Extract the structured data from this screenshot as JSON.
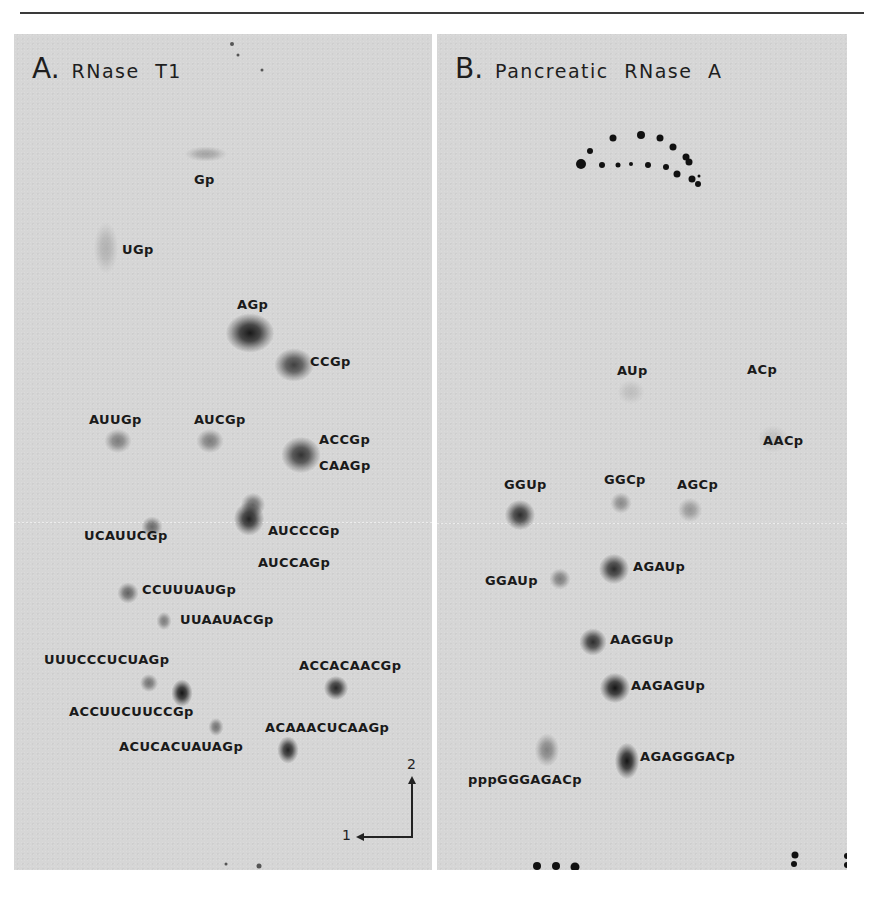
{
  "figure": {
    "panels": [
      {
        "id": "A",
        "letter": "A.",
        "title": "RNase T1",
        "spots": [
          {
            "label": "Gp",
            "x": 192,
            "y": 120,
            "w": 28,
            "h": 10,
            "intensity": 0.25,
            "label_x": 180,
            "label_y": 138
          },
          {
            "label": "UGp",
            "x": 92,
            "y": 214,
            "w": 16,
            "h": 34,
            "intensity": 0.18,
            "label_x": 108,
            "label_y": 208
          },
          {
            "label": "AGp",
            "x": 236,
            "y": 299,
            "w": 32,
            "h": 26,
            "intensity": 0.95,
            "label_x": 223,
            "label_y": 263
          },
          {
            "label": "CCGp",
            "x": 280,
            "y": 331,
            "w": 26,
            "h": 22,
            "intensity": 0.75,
            "label_x": 296,
            "label_y": 320
          },
          {
            "label": "AUUGp",
            "x": 104,
            "y": 407,
            "w": 18,
            "h": 16,
            "intensity": 0.45,
            "label_x": 75,
            "label_y": 378
          },
          {
            "label": "AUCGp",
            "x": 196,
            "y": 407,
            "w": 18,
            "h": 16,
            "intensity": 0.45,
            "label_x": 180,
            "label_y": 378
          },
          {
            "label": "ACCGp",
            "x": 287,
            "y": 421,
            "w": 26,
            "h": 24,
            "intensity": 0.82,
            "label_x": 305,
            "label_y": 398
          },
          {
            "label": "CAAGp",
            "x": null,
            "y": null,
            "w": 0,
            "h": 0,
            "intensity": 0,
            "label_x": 305,
            "label_y": 424
          },
          {
            "label": "AUCCCGp",
            "x": 239,
            "y": 471,
            "w": 16,
            "h": 16,
            "intensity": 0.55,
            "label_x": 254,
            "label_y": 489
          },
          {
            "label": "AUCCAGp",
            "x": 235,
            "y": 485,
            "w": 20,
            "h": 22,
            "intensity": 0.9,
            "label_x": 244,
            "label_y": 521
          },
          {
            "label": "UCAUUCGp",
            "x": 138,
            "y": 493,
            "w": 14,
            "h": 14,
            "intensity": 0.55,
            "label_x": 70,
            "label_y": 494
          },
          {
            "label": "CCUUUAUGp",
            "x": 114,
            "y": 559,
            "w": 14,
            "h": 14,
            "intensity": 0.58,
            "label_x": 128,
            "label_y": 548
          },
          {
            "label": "UUAAUACGp",
            "x": 150,
            "y": 587,
            "w": 10,
            "h": 12,
            "intensity": 0.45,
            "label_x": 166,
            "label_y": 578
          },
          {
            "label": "UUUCCCUCUAGp",
            "x": 135,
            "y": 649,
            "w": 12,
            "h": 12,
            "intensity": 0.5,
            "label_x": 30,
            "label_y": 618
          },
          {
            "label": "ACCUUCUUCCGp",
            "x": 168,
            "y": 659,
            "w": 14,
            "h": 18,
            "intensity": 0.97,
            "label_x": 55,
            "label_y": 670
          },
          {
            "label": "ACCACAACGp",
            "x": 322,
            "y": 654,
            "w": 16,
            "h": 16,
            "intensity": 0.88,
            "label_x": 285,
            "label_y": 624
          },
          {
            "label": "ACUCACUAUAGp",
            "x": 202,
            "y": 693,
            "w": 10,
            "h": 12,
            "intensity": 0.5,
            "label_x": 105,
            "label_y": 705
          },
          {
            "label": "ACAAACUCAAGp",
            "x": 274,
            "y": 716,
            "w": 14,
            "h": 18,
            "intensity": 0.9,
            "label_x": 251,
            "label_y": 686
          }
        ],
        "stray_dots": [
          {
            "x": 218,
            "y": 10,
            "r": 2
          },
          {
            "x": 224,
            "y": 21,
            "r": 1.5
          },
          {
            "x": 248,
            "y": 36,
            "r": 1.5
          },
          {
            "x": 212,
            "y": 830,
            "r": 1.5
          },
          {
            "x": 245,
            "y": 832,
            "r": 2.5
          }
        ],
        "axes": {
          "dim1_label": "1",
          "dim2_label": "2"
        }
      },
      {
        "id": "B",
        "letter": "B.",
        "title": "Pancreatic RNase A",
        "spots": [
          {
            "label": "AUp",
            "x": 194,
            "y": 358,
            "w": 18,
            "h": 16,
            "intensity": 0.12,
            "label_x": 180,
            "label_y": 329
          },
          {
            "label": "ACp",
            "x": null,
            "y": null,
            "w": 0,
            "h": 0,
            "intensity": 0,
            "label_x": 310,
            "label_y": 328
          },
          {
            "label": "AACp",
            "x": 336,
            "y": 405,
            "w": 20,
            "h": 18,
            "intensity": 0.12,
            "label_x": 326,
            "label_y": 399
          },
          {
            "label": "GGUp",
            "x": 83,
            "y": 481,
            "w": 20,
            "h": 20,
            "intensity": 0.85,
            "label_x": 67,
            "label_y": 443
          },
          {
            "label": "GGCp",
            "x": 184,
            "y": 469,
            "w": 14,
            "h": 14,
            "intensity": 0.38,
            "label_x": 167,
            "label_y": 438
          },
          {
            "label": "AGCp",
            "x": 253,
            "y": 476,
            "w": 16,
            "h": 16,
            "intensity": 0.32,
            "label_x": 240,
            "label_y": 443
          },
          {
            "label": "AGAUp",
            "x": 177,
            "y": 535,
            "w": 20,
            "h": 20,
            "intensity": 0.85,
            "label_x": 196,
            "label_y": 525
          },
          {
            "label": "GGAUp",
            "x": 123,
            "y": 545,
            "w": 14,
            "h": 14,
            "intensity": 0.45,
            "label_x": 48,
            "label_y": 539
          },
          {
            "label": "AAGGUp",
            "x": 156,
            "y": 608,
            "w": 18,
            "h": 18,
            "intensity": 0.85,
            "label_x": 173,
            "label_y": 598
          },
          {
            "label": "AAGAGUp",
            "x": 178,
            "y": 654,
            "w": 20,
            "h": 20,
            "intensity": 0.97,
            "label_x": 194,
            "label_y": 644
          },
          {
            "label": "AGAGGGACp",
            "x": 190,
            "y": 727,
            "w": 16,
            "h": 24,
            "intensity": 0.97,
            "label_x": 203,
            "label_y": 715
          },
          {
            "label": "pppGGGAGACp",
            "x": 110,
            "y": 716,
            "w": 16,
            "h": 22,
            "intensity": 0.42,
            "label_x": 31,
            "label_y": 738
          }
        ],
        "marker_dots": [
          {
            "x": 144,
            "y": 130,
            "r": 5
          },
          {
            "x": 153,
            "y": 117,
            "r": 3
          },
          {
            "x": 176,
            "y": 104,
            "r": 3.5
          },
          {
            "x": 204,
            "y": 101,
            "r": 4
          },
          {
            "x": 223,
            "y": 104,
            "r": 3.5
          },
          {
            "x": 236,
            "y": 113,
            "r": 3.5
          },
          {
            "x": 249,
            "y": 123,
            "r": 3.5
          },
          {
            "x": 252,
            "y": 128,
            "r": 3.5
          },
          {
            "x": 165,
            "y": 131,
            "r": 3
          },
          {
            "x": 181,
            "y": 131,
            "r": 2.5
          },
          {
            "x": 194,
            "y": 130,
            "r": 2
          },
          {
            "x": 211,
            "y": 131,
            "r": 3
          },
          {
            "x": 229,
            "y": 133,
            "r": 3
          },
          {
            "x": 240,
            "y": 140,
            "r": 3.5
          },
          {
            "x": 255,
            "y": 145,
            "r": 3.5
          },
          {
            "x": 261,
            "y": 150,
            "r": 3
          },
          {
            "x": 262,
            "y": 142,
            "r": 1.5
          },
          {
            "x": 100,
            "y": 832,
            "r": 4
          },
          {
            "x": 119,
            "y": 832,
            "r": 4
          },
          {
            "x": 138,
            "y": 833,
            "r": 4.5
          },
          {
            "x": 358,
            "y": 821,
            "r": 3.5
          },
          {
            "x": 357,
            "y": 830,
            "r": 3
          },
          {
            "x": 410,
            "y": 822,
            "r": 3
          },
          {
            "x": 410,
            "y": 831,
            "r": 3
          }
        ]
      }
    ],
    "colors": {
      "background": "#d6d6d6",
      "spot": "#141414",
      "text": "#1a1a1a"
    }
  }
}
